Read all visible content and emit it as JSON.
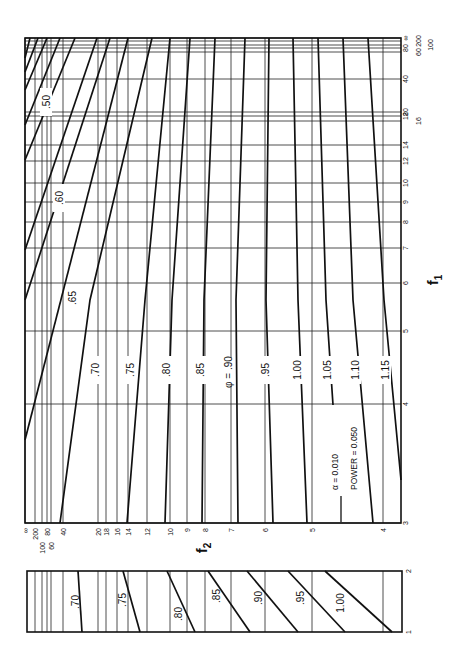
{
  "chart_data": [
    {
      "type": "line",
      "title": "Power curves (rotated nomograph)",
      "annotation": [
        "α = 0.010",
        "POWER = 0.050"
      ],
      "xlabel": "f2",
      "ylabel": "f1",
      "x_ticks": [
        {
          "label": "∞",
          "x": 25
        },
        {
          "label": "200",
          "x": 35
        },
        {
          "label": "100",
          "x": 42
        },
        {
          "label": "80",
          "x": 47
        },
        {
          "label": "60",
          "x": 51
        },
        {
          "label": "40",
          "x": 63
        },
        {
          "label": "20",
          "x": 98
        },
        {
          "label": "18",
          "x": 106
        },
        {
          "label": "16",
          "x": 117
        },
        {
          "label": "14",
          "x": 128
        },
        {
          "label": "12",
          "x": 147
        },
        {
          "label": "10",
          "x": 170
        },
        {
          "label": "9",
          "x": 187
        },
        {
          "label": "8",
          "x": 205
        },
        {
          "label": "7",
          "x": 231
        },
        {
          "label": "6",
          "x": 265
        },
        {
          "label": "5",
          "x": 312
        },
        {
          "label": "4",
          "x": 383
        }
      ],
      "y_ticks": [
        {
          "label": "∞",
          "y": 38
        },
        {
          "label": "200",
          "y": 41
        },
        {
          "label": "100",
          "y": 45
        },
        {
          "label": "80",
          "y": 48
        },
        {
          "label": "60",
          "y": 52
        },
        {
          "label": "40",
          "y": 79
        },
        {
          "label": "20",
          "y": 112
        },
        {
          "label": "18",
          "y": 116
        },
        {
          "label": "16",
          "y": 121
        },
        {
          "label": "14",
          "y": 145
        },
        {
          "label": "12",
          "y": 161
        },
        {
          "label": "10",
          "y": 183
        },
        {
          "label": "9",
          "y": 202
        },
        {
          "label": "8",
          "y": 222
        },
        {
          "label": "7",
          "y": 248
        },
        {
          "label": "6",
          "y": 283
        },
        {
          "label": "5",
          "y": 331
        },
        {
          "label": "4",
          "y": 404
        },
        {
          "label": "3",
          "y": 523
        }
      ],
      "frame": {
        "x0": 25,
        "y0": 38,
        "x1": 401,
        "y1": 523
      },
      "series": [
        {
          "name": "",
          "points": [
            [
              25,
              58
            ],
            [
              30,
              38
            ]
          ]
        },
        {
          "name": "",
          "points": [
            [
              25,
              72
            ],
            [
              38,
              38
            ]
          ]
        },
        {
          "name": "",
          "points": [
            [
              25,
              90
            ],
            [
              47,
              38
            ]
          ]
        },
        {
          "name": ".50",
          "points": [
            [
              25,
              125
            ],
            [
              60,
              38
            ]
          ]
        },
        {
          "name": "",
          "points": [
            [
              25,
              160
            ],
            [
              75,
              38
            ]
          ]
        },
        {
          "name": ".60",
          "points": [
            [
              25,
              250
            ],
            [
              97,
              38
            ]
          ]
        },
        {
          "name": "",
          "points": [
            [
              25,
              300
            ],
            [
              110,
              38
            ]
          ]
        },
        {
          "name": ".65",
          "points": [
            [
              25,
              440
            ],
            [
              128,
              38
            ]
          ]
        },
        {
          "name": ".70",
          "points": [
            [
              60,
              523
            ],
            [
              90,
              300
            ],
            [
              152,
              38
            ]
          ]
        },
        {
          "name": ".75",
          "points": [
            [
              127,
              523
            ],
            [
              145,
              300
            ],
            [
              170,
              38
            ]
          ]
        },
        {
          "name": ".80",
          "points": [
            [
              165,
              523
            ],
            [
              172,
              300
            ],
            [
              190,
              38
            ]
          ]
        },
        {
          "name": ".85",
          "points": [
            [
              202,
              523
            ],
            [
              204,
              300
            ],
            [
              215,
              38
            ]
          ]
        },
        {
          "name": "φ = .90",
          "points": [
            [
              238,
              523
            ],
            [
              236,
              300
            ],
            [
              245,
              38
            ]
          ]
        },
        {
          "name": ".95",
          "points": [
            [
              273,
              523
            ],
            [
              266,
              300
            ],
            [
              269,
              38
            ]
          ]
        },
        {
          "name": "1.00",
          "points": [
            [
              307,
              523
            ],
            [
              298,
              300
            ],
            [
              293,
              38
            ]
          ]
        },
        {
          "name": "1.05",
          "points": [
            [
              333,
              405
            ],
            [
              326,
              300
            ],
            [
              318,
              38
            ]
          ]
        },
        {
          "name": "1.10",
          "points": [
            [
              373,
              523
            ],
            [
              353,
              300
            ],
            [
              343,
              38
            ]
          ]
        },
        {
          "name": "1.15",
          "points": [
            [
              401,
              480
            ],
            [
              384,
              300
            ],
            [
              368,
              38
            ]
          ]
        }
      ],
      "labels": [
        {
          "text": ".50",
          "x": 46,
          "y": 102
        },
        {
          "text": ".60",
          "x": 59,
          "y": 198
        },
        {
          "text": ".65",
          "x": 72,
          "y": 298
        },
        {
          "text": ".70",
          "x": 95,
          "y": 370
        },
        {
          "text": ".75",
          "x": 130,
          "y": 370
        },
        {
          "text": ".80",
          "x": 166,
          "y": 370
        },
        {
          "text": ".85",
          "x": 200,
          "y": 370
        },
        {
          "text": "φ = .90",
          "x": 228,
          "y": 372
        },
        {
          "text": ".95",
          "x": 265,
          "y": 370
        },
        {
          "text": "1.00",
          "x": 297,
          "y": 370
        },
        {
          "text": "1.05",
          "x": 327,
          "y": 370
        },
        {
          "text": "1.10",
          "x": 355,
          "y": 370
        },
        {
          "text": "1.15",
          "x": 385,
          "y": 370
        }
      ]
    },
    {
      "type": "line",
      "title": "Auxiliary panel",
      "ylabel_ticks": [
        "1",
        "2"
      ],
      "frame": {
        "x0": 27,
        "y0": 571,
        "x1": 402,
        "y1": 632
      },
      "series": [
        {
          "name": ".70",
          "points": [
            [
              78,
              571
            ],
            [
              82,
              632
            ]
          ]
        },
        {
          "name": ".75",
          "points": [
            [
              123,
              571
            ],
            [
              140,
              632
            ]
          ]
        },
        {
          "name": ".80",
          "points": [
            [
              167,
              571
            ],
            [
              195,
              632
            ]
          ]
        },
        {
          "name": ".85",
          "points": [
            [
              208,
              571
            ],
            [
              250,
              632
            ]
          ]
        },
        {
          "name": ".90",
          "points": [
            [
              247,
              571
            ],
            [
              298,
              632
            ]
          ]
        },
        {
          "name": ".95",
          "points": [
            [
              288,
              571
            ],
            [
              345,
              632
            ]
          ]
        },
        {
          "name": "1.00",
          "points": [
            [
              325,
              571
            ],
            [
              392,
              632
            ]
          ]
        }
      ],
      "labels": [
        {
          "text": ".70",
          "x": 75,
          "y": 602
        },
        {
          "text": ".75",
          "x": 122,
          "y": 600
        },
        {
          "text": ".80",
          "x": 178,
          "y": 614
        },
        {
          "text": ".85",
          "x": 216,
          "y": 596
        },
        {
          "text": ".90",
          "x": 258,
          "y": 598
        },
        {
          "text": ".95",
          "x": 300,
          "y": 598
        },
        {
          "text": "1.00",
          "x": 340,
          "y": 603
        }
      ]
    }
  ],
  "axis_titles": {
    "f1": "f",
    "f1_sub": "1",
    "f2": "f",
    "f2_sub": "2"
  },
  "annotation": {
    "alpha": "α  =  0.010",
    "power": "POWER = 0.050"
  }
}
